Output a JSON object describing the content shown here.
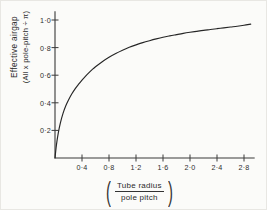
{
  "figure": {
    "background_color": "#fbfbf9",
    "ink_color": "#262626"
  },
  "ylabel": {
    "line1": "Effective airgap",
    "line2": "(All x pole-pitch ÷ π)"
  },
  "xlabel": {
    "numerator": "Tube radius",
    "denominator": "pole pitch",
    "open_paren": "(",
    "close_paren": ")"
  },
  "ticks": {
    "x": [
      "0·4",
      "0·8",
      "1·2",
      "1·6",
      "2·0",
      "2·4",
      "2·8"
    ],
    "y": [
      "0·2",
      "0·4",
      "0·6",
      "0·8",
      "1·0"
    ]
  },
  "chart_data": {
    "type": "line",
    "title": "",
    "xlabel": "(Tube radius / pole pitch)",
    "ylabel": "Effective airgap (All x pole-pitch ÷ π)",
    "xlim": [
      0,
      2.95
    ],
    "ylim": [
      0,
      1.06
    ],
    "xticks": [
      0.4,
      0.8,
      1.2,
      1.6,
      2.0,
      2.4,
      2.8
    ],
    "xticklabels": [
      "0·4",
      "0·8",
      "1·2",
      "1·6",
      "2·0",
      "2·4",
      "2·8"
    ],
    "yticks": [
      0.2,
      0.4,
      0.6,
      0.8,
      1.0
    ],
    "yticklabels": [
      "0·2",
      "0·4",
      "0·6",
      "0·8",
      "1·0"
    ],
    "grid": false,
    "legend": null,
    "series": [
      {
        "name": "effective airgap ratio",
        "x": [
          0.0,
          0.02,
          0.05,
          0.08,
          0.12,
          0.16,
          0.2,
          0.25,
          0.3,
          0.35,
          0.4,
          0.45,
          0.5,
          0.55,
          0.6,
          0.7,
          0.8,
          0.9,
          1.0,
          1.1,
          1.2,
          1.3,
          1.4,
          1.5,
          1.6,
          1.7,
          1.8,
          1.9,
          2.0,
          2.1,
          2.2,
          2.3,
          2.4,
          2.5,
          2.6,
          2.7,
          2.8,
          2.9
        ],
        "y": [
          0.0,
          0.09,
          0.185,
          0.255,
          0.325,
          0.378,
          0.42,
          0.465,
          0.503,
          0.535,
          0.565,
          0.592,
          0.617,
          0.64,
          0.661,
          0.698,
          0.73,
          0.757,
          0.781,
          0.802,
          0.82,
          0.836,
          0.85,
          0.863,
          0.875,
          0.885,
          0.894,
          0.903,
          0.911,
          0.918,
          0.925,
          0.931,
          0.937,
          0.943,
          0.949,
          0.955,
          0.962,
          0.97
        ]
      }
    ]
  },
  "geometry": {
    "origin_x_px": 55,
    "origin_y_px": 158,
    "x_px_per_unit": 67.5,
    "y_px_per_unit": 138
  }
}
